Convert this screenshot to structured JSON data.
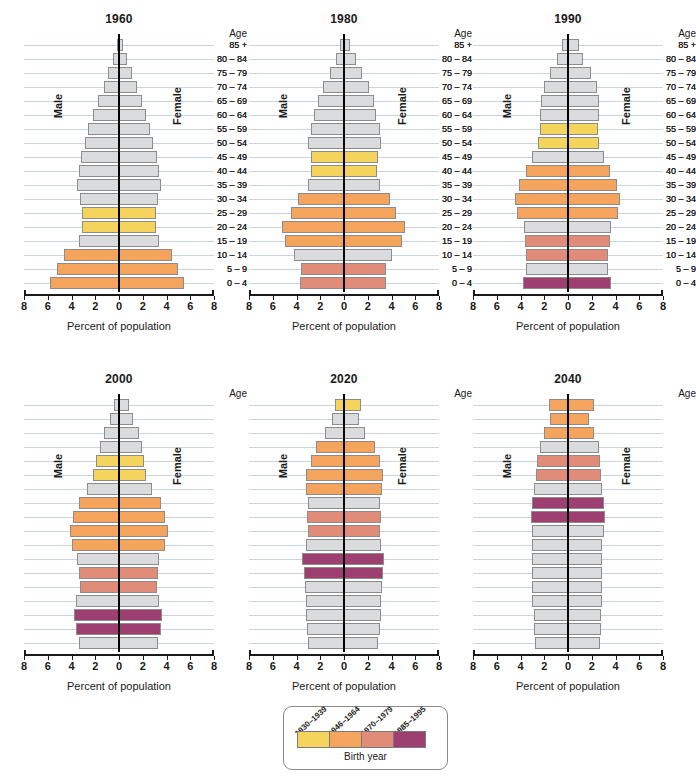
{
  "axis": {
    "xlabel": "Percent of population",
    "ticks": [
      8,
      6,
      4,
      2,
      0,
      2,
      4,
      6,
      8
    ],
    "tick_labels": [
      "8",
      "6",
      "4",
      "2",
      "0",
      "2",
      "4",
      "6",
      "8"
    ],
    "xlim": [
      -8,
      8
    ],
    "male_label": "Male",
    "female_label": "Female",
    "age_header": "Age"
  },
  "age_groups": [
    "0 – 4",
    "5 – 9",
    "10 – 14",
    "15 – 19",
    "20 – 24",
    "25 – 29",
    "30 – 34",
    "35 – 39",
    "40 – 44",
    "45 – 49",
    "50 – 54",
    "55 – 59",
    "60 – 64",
    "65 – 69",
    "70 – 74",
    "75 – 79",
    "80 – 84",
    "85 +"
  ],
  "colors": {
    "gray": "#D9DBDD",
    "yellow": "#F5D45E",
    "orange": "#F4A45C",
    "salmon": "#E08C78",
    "purple": "#9D3F70",
    "gridline": "#C9D4DE",
    "axis": "#1A1A1A"
  },
  "legend": {
    "caption": "Birth year",
    "entries": [
      {
        "label": "1930–1939",
        "color": "#F5D45E"
      },
      {
        "label": "1946–1964",
        "color": "#F4A45C"
      },
      {
        "label": "1970–1979",
        "color": "#E08C78"
      },
      {
        "label": "1985–1995",
        "color": "#9D3F70"
      }
    ]
  },
  "chart_data": {
    "type": "bar",
    "chart_kind": "population-pyramid",
    "xlabel": "Percent of population",
    "ylabel": "Age",
    "xlim": [
      -8,
      8
    ],
    "grid": true,
    "legend_position": "bottom-center",
    "categories": [
      "0 – 4",
      "5 – 9",
      "10 – 14",
      "15 – 19",
      "20 – 24",
      "25 – 29",
      "30 – 34",
      "35 – 39",
      "40 – 44",
      "45 – 49",
      "50 – 54",
      "55 – 59",
      "60 – 64",
      "65 – 69",
      "70 – 74",
      "75 – 79",
      "80 – 84",
      "85 +"
    ],
    "panels": [
      {
        "title": "1960",
        "male": [
          5.8,
          5.2,
          4.6,
          3.4,
          3.1,
          3.1,
          3.3,
          3.5,
          3.4,
          3.2,
          2.9,
          2.6,
          2.2,
          1.8,
          1.3,
          0.9,
          0.5,
          0.2
        ],
        "female": [
          5.5,
          5.0,
          4.5,
          3.4,
          3.1,
          3.1,
          3.3,
          3.5,
          3.4,
          3.2,
          2.9,
          2.6,
          2.3,
          1.9,
          1.5,
          1.1,
          0.7,
          0.3
        ],
        "cohort_colors": [
          "orange",
          "orange",
          "orange",
          "gray",
          "yellow",
          "yellow",
          "gray",
          "gray",
          "gray",
          "gray",
          "gray",
          "gray",
          "gray",
          "gray",
          "gray",
          "gray",
          "gray",
          "gray"
        ]
      },
      {
        "title": "1980",
        "male": [
          3.7,
          3.6,
          4.2,
          5.0,
          5.2,
          4.5,
          3.9,
          3.0,
          2.8,
          2.8,
          3.0,
          2.8,
          2.5,
          2.2,
          1.8,
          1.2,
          0.7,
          0.3
        ],
        "female": [
          3.5,
          3.5,
          4.0,
          4.9,
          5.1,
          4.4,
          3.9,
          3.0,
          2.8,
          2.9,
          3.1,
          3.0,
          2.7,
          2.5,
          2.1,
          1.5,
          1.0,
          0.5
        ],
        "cohort_colors": [
          "salmon",
          "salmon",
          "gray",
          "orange",
          "orange",
          "orange",
          "orange",
          "gray",
          "yellow",
          "yellow",
          "gray",
          "gray",
          "gray",
          "gray",
          "gray",
          "gray",
          "gray",
          "gray"
        ]
      },
      {
        "title": "1990",
        "male": [
          3.8,
          3.5,
          3.5,
          3.6,
          3.7,
          4.3,
          4.5,
          4.1,
          3.5,
          3.0,
          2.5,
          2.4,
          2.4,
          2.3,
          2.0,
          1.5,
          0.9,
          0.5
        ],
        "female": [
          3.6,
          3.4,
          3.4,
          3.5,
          3.6,
          4.2,
          4.4,
          4.1,
          3.5,
          3.0,
          2.6,
          2.5,
          2.6,
          2.6,
          2.4,
          1.9,
          1.3,
          0.9
        ],
        "cohort_colors": [
          "purple",
          "gray",
          "salmon",
          "salmon",
          "gray",
          "orange",
          "orange",
          "orange",
          "orange",
          "gray",
          "yellow",
          "yellow",
          "gray",
          "gray",
          "gray",
          "gray",
          "gray",
          "gray"
        ]
      },
      {
        "title": "2000",
        "male": [
          3.4,
          3.6,
          3.8,
          3.6,
          3.3,
          3.4,
          3.5,
          4.0,
          4.1,
          3.9,
          3.4,
          2.7,
          2.2,
          1.9,
          1.6,
          1.3,
          0.8,
          0.4
        ],
        "female": [
          3.3,
          3.5,
          3.6,
          3.4,
          3.2,
          3.3,
          3.4,
          3.9,
          4.1,
          3.9,
          3.5,
          2.8,
          2.3,
          2.1,
          1.9,
          1.7,
          1.2,
          0.8
        ],
        "cohort_colors": [
          "gray",
          "purple",
          "purple",
          "gray",
          "salmon",
          "salmon",
          "gray",
          "orange",
          "orange",
          "orange",
          "orange",
          "gray",
          "yellow",
          "yellow",
          "gray",
          "gray",
          "gray",
          "gray"
        ]
      },
      {
        "title": "2020",
        "male": [
          3.0,
          3.1,
          3.2,
          3.2,
          3.3,
          3.4,
          3.5,
          3.2,
          3.0,
          3.1,
          3.0,
          3.2,
          3.2,
          2.8,
          2.4,
          1.6,
          1.0,
          0.8
        ],
        "female": [
          2.9,
          3.0,
          3.1,
          3.1,
          3.2,
          3.3,
          3.4,
          3.1,
          3.0,
          3.1,
          3.0,
          3.2,
          3.3,
          3.0,
          2.6,
          1.8,
          1.3,
          1.4
        ],
        "cohort_colors": [
          "gray",
          "gray",
          "gray",
          "gray",
          "gray",
          "purple",
          "purple",
          "gray",
          "salmon",
          "salmon",
          "gray",
          "orange",
          "orange",
          "orange",
          "orange",
          "gray",
          "gray",
          "yellow"
        ]
      },
      {
        "title": "2040",
        "male": [
          2.8,
          2.9,
          2.9,
          3.0,
          3.0,
          3.0,
          3.0,
          3.0,
          3.0,
          3.1,
          3.0,
          2.9,
          2.7,
          2.6,
          2.4,
          2.0,
          1.5,
          1.6
        ],
        "female": [
          2.7,
          2.8,
          2.8,
          2.9,
          2.9,
          2.9,
          2.9,
          2.9,
          3.0,
          3.1,
          3.0,
          2.9,
          2.8,
          2.7,
          2.6,
          2.2,
          1.8,
          2.2
        ],
        "cohort_colors": [
          "gray",
          "gray",
          "gray",
          "gray",
          "gray",
          "gray",
          "gray",
          "gray",
          "gray",
          "purple",
          "purple",
          "gray",
          "salmon",
          "salmon",
          "gray",
          "orange",
          "orange",
          "orange"
        ]
      }
    ]
  }
}
